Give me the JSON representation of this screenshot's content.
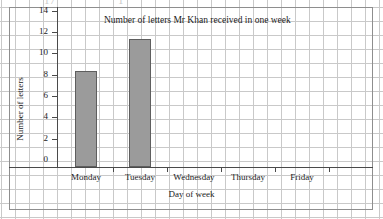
{
  "page": {
    "clipped_text_above": {
      "fragment_left": "17",
      "fragment_right": "1"
    }
  },
  "chart_data": {
    "type": "bar",
    "title": "Number of letters Mr Khan received in one week",
    "xlabel": "Day of week",
    "ylabel": "Number of letters",
    "categories": [
      "Monday",
      "Tuesday",
      "Wednesday",
      "Thursday",
      "Friday"
    ],
    "values": [
      9,
      12,
      0,
      0,
      0
    ],
    "ylim": [
      0,
      15
    ],
    "ytick_labels": [
      "0",
      "2",
      "4",
      "6",
      "8",
      "10",
      "12",
      "14"
    ],
    "ytick_values": [
      0,
      2,
      4,
      6,
      8,
      10,
      12,
      14
    ],
    "grid": true,
    "legend": null,
    "bar_color": "#9b9b9b",
    "bar_edge_color": "#5e5e5e",
    "grid_color": "#c9c9c9",
    "axis_color": "#4a4a4a",
    "background_color": "#ffffff"
  }
}
